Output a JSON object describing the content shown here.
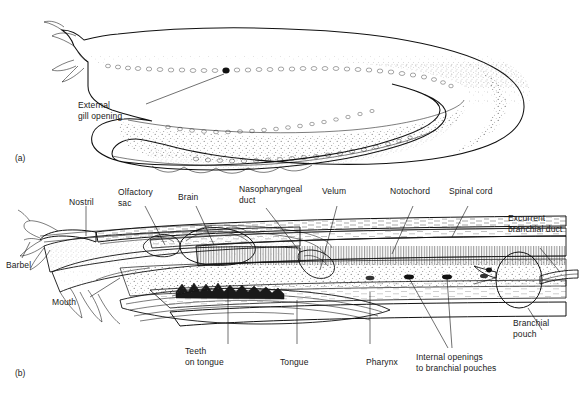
{
  "figure": {
    "panels": [
      {
        "id": "panel-a",
        "label": "(a)",
        "caption": "External lateral view of hagfish"
      },
      {
        "id": "panel-b",
        "label": "(b)",
        "caption": "Sagittal section of hagfish head"
      }
    ]
  },
  "panel_a": {
    "label": "(a)",
    "labels": [
      {
        "name": "external-gill-opening",
        "line1": "External",
        "line2": "gill opening"
      }
    ]
  },
  "panel_b": {
    "label": "(b)",
    "labels": [
      {
        "name": "nostril",
        "line1": "Nostril",
        "line2": ""
      },
      {
        "name": "olfactory-sac",
        "line1": "Olfactory",
        "line2": "sac"
      },
      {
        "name": "brain",
        "line1": "Brain",
        "line2": ""
      },
      {
        "name": "nasopharyngeal-duct",
        "line1": "Nasopharyngeal",
        "line2": "duct"
      },
      {
        "name": "velum",
        "line1": "Velum",
        "line2": ""
      },
      {
        "name": "notochord",
        "line1": "Notochord",
        "line2": ""
      },
      {
        "name": "spinal-cord",
        "line1": "Spinal cord",
        "line2": ""
      },
      {
        "name": "excurrent-branchial-duct",
        "line1": "Excurrent",
        "line2": "branchial duct"
      },
      {
        "name": "barbel",
        "line1": "Barbel",
        "line2": ""
      },
      {
        "name": "mouth",
        "line1": "Mouth",
        "line2": ""
      },
      {
        "name": "teeth-on-tongue",
        "line1": "Teeth",
        "line2": "on tongue"
      },
      {
        "name": "tongue",
        "line1": "Tongue",
        "line2": ""
      },
      {
        "name": "pharynx",
        "line1": "Pharynx",
        "line2": ""
      },
      {
        "name": "internal-openings",
        "line1": "Internal openings",
        "line2": "to branchial pouches"
      },
      {
        "name": "branchial-pouch",
        "line1": "Branchial",
        "line2": "pouch"
      }
    ]
  },
  "colors": {
    "ink": "#1a1a1a",
    "background": "#ffffff",
    "line": "#111111"
  }
}
